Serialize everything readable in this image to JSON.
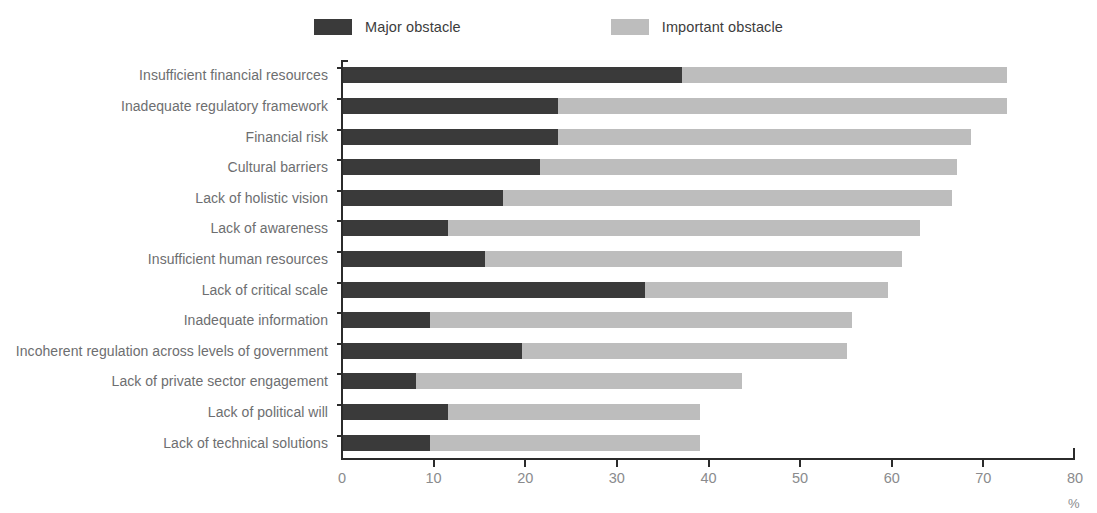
{
  "legend": {
    "entries": [
      {
        "label": "Major obstacle",
        "color": "#3a3a3a",
        "key": "major"
      },
      {
        "label": "Important obstacle",
        "color": "#bdbdbd",
        "key": "important"
      }
    ]
  },
  "axis": {
    "unit_label": "%",
    "tick_labels": [
      "0",
      "10",
      "20",
      "30",
      "40",
      "50",
      "60",
      "70",
      "80"
    ]
  },
  "chart_data": {
    "type": "bar",
    "orientation": "horizontal",
    "stacked": true,
    "title": "",
    "subtitle": "",
    "xlabel": "%",
    "ylabel": "",
    "xlim": [
      0,
      80
    ],
    "xticks": [
      0,
      10,
      20,
      30,
      40,
      50,
      60,
      70,
      80
    ],
    "grid": false,
    "legend_position": "top-center",
    "categories": [
      "Insufficient financial resources",
      "Inadequate regulatory framework",
      "Financial risk",
      "Cultural barriers",
      "Lack of holistic vision",
      "Lack of awareness",
      "Insufficient human resources",
      "Lack of critical scale",
      "Inadequate information",
      "Incoherent regulation across levels of government",
      "Lack of private sector engagement",
      "Lack of political will",
      "Lack of technical solutions"
    ],
    "series": [
      {
        "name": "Major obstacle",
        "color": "#3a3a3a",
        "values": [
          37.0,
          23.5,
          23.5,
          21.5,
          17.5,
          11.5,
          15.5,
          33.0,
          9.5,
          19.5,
          8.0,
          11.5,
          9.5
        ]
      },
      {
        "name": "Important obstacle",
        "color": "#bdbdbd",
        "values": [
          35.5,
          49.0,
          45.0,
          45.5,
          49.0,
          51.5,
          45.5,
          26.5,
          46.0,
          35.5,
          35.5,
          27.5,
          29.5
        ]
      }
    ],
    "totals": [
      72.5,
      72.5,
      68.5,
      67.0,
      66.5,
      63.0,
      61.0,
      59.5,
      55.5,
      55.0,
      43.5,
      39.0,
      39.0
    ]
  }
}
